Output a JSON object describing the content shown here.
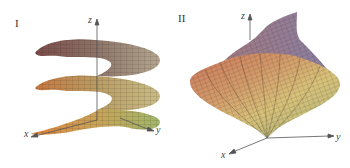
{
  "figure": {
    "panels": [
      {
        "label": "I",
        "surface": "helicoid-spiral-ramp",
        "axes": {
          "x": "x",
          "y": "y",
          "z": "z"
        }
      },
      {
        "label": "II",
        "surface": "twisted-spindle",
        "axes": {
          "x": "x",
          "y": "y",
          "z": "z"
        }
      }
    ],
    "colors": {
      "background": "#ffffff",
      "axis": "#555555",
      "mesh": "#2a2418",
      "surface_dark": "#6b3f3a",
      "surface_orange": "#d98a4a",
      "surface_yellow": "#d9c777",
      "surface_green": "#8fb060",
      "surface_mauve": "#9c8aa8"
    }
  }
}
